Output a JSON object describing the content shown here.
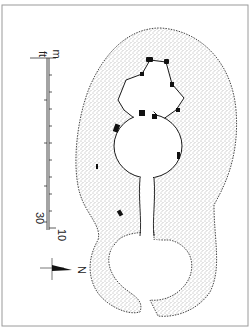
{
  "figure": {
    "type": "archaeological site plan",
    "scale_bar": {
      "orientation": "vertical",
      "metric_unit": "m",
      "imperial_unit": "ft",
      "metric_end_label": "10",
      "imperial_end_label": "30",
      "metric_ticks": 10,
      "imperial_ticks": 6
    },
    "north_arrow": {
      "label": "N",
      "direction": "right"
    },
    "colors": {
      "ink": "#1a1a1a",
      "stipple": "#555555",
      "frame": "#9a9a9a",
      "background": "#ffffff"
    }
  }
}
